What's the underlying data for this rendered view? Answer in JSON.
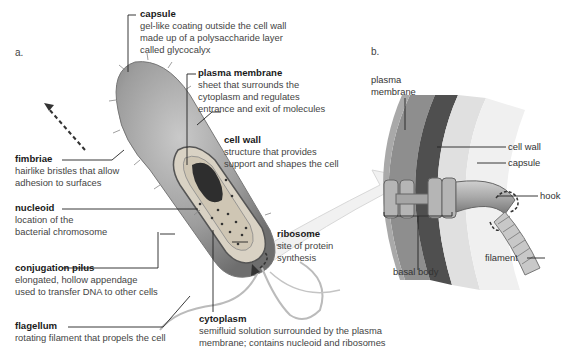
{
  "panels": {
    "a": "a.",
    "b": "b."
  },
  "labels_a": [
    {
      "key": "capsule",
      "title": "capsule",
      "desc": [
        "gel-like coating outside the cell wall",
        "made up of a polysaccharide layer",
        "called glycocalyx"
      ]
    },
    {
      "key": "plasma_membrane",
      "title": "plasma membrane",
      "desc": [
        "sheet that surrounds the",
        "cytoplasm and regulates",
        "entrance and exit of molecules"
      ]
    },
    {
      "key": "cell_wall",
      "title": "cell wall",
      "desc": [
        "structure that provides",
        "support and shapes the cell"
      ]
    },
    {
      "key": "fimbriae",
      "title": "fimbriae",
      "desc": [
        "hairlike bristles that allow",
        "adhesion to surfaces"
      ]
    },
    {
      "key": "nucleoid",
      "title": "nucleoid",
      "desc": [
        "location of the",
        "bacterial chromosome"
      ]
    },
    {
      "key": "ribosome",
      "title": "ribosome",
      "desc": [
        "site of protein",
        "synthesis"
      ]
    },
    {
      "key": "conjugation_pilus",
      "title": "conjugation pilus",
      "desc": [
        "elongated, hollow appendage",
        "used to transfer DNA to other cells"
      ]
    },
    {
      "key": "cytoplasm",
      "title": "cytoplasm",
      "desc": [
        "semifluid solution surrounded by the plasma",
        "membrane; contains nucleoid and ribosomes"
      ]
    },
    {
      "key": "flagellum",
      "title": "flagellum",
      "desc": [
        "rotating filament that propels the cell"
      ]
    }
  ],
  "labels_b": {
    "plasma_membrane": [
      "plasma",
      "membrane"
    ],
    "cell_wall": "cell wall",
    "capsule": "capsule",
    "hook": "hook",
    "basal_body": "basal body",
    "filament": "filament"
  },
  "colors": {
    "cell_body": "#9a9a9a",
    "cell_dark": "#5a5a5a",
    "capsule_ring": "#d6d6d6",
    "arrow": "#e6e6e6",
    "leader": "#222222"
  }
}
